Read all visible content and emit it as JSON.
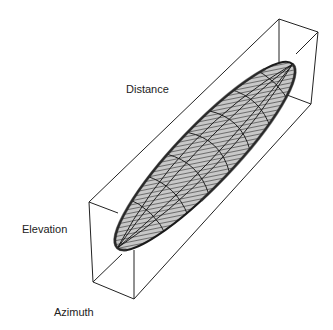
{
  "figure": {
    "type": "3d-box-ellipsoid",
    "colors": {
      "background": "#ffffff",
      "box_edge": "#222222",
      "surface_fill": "#b4b4b4",
      "surface_dark": "#5a5a5a",
      "mesh_line": "#1a1a1a"
    }
  },
  "labels": {
    "distance": "Distance",
    "elevation": "Elevation",
    "azimuth": "Azimuth"
  }
}
